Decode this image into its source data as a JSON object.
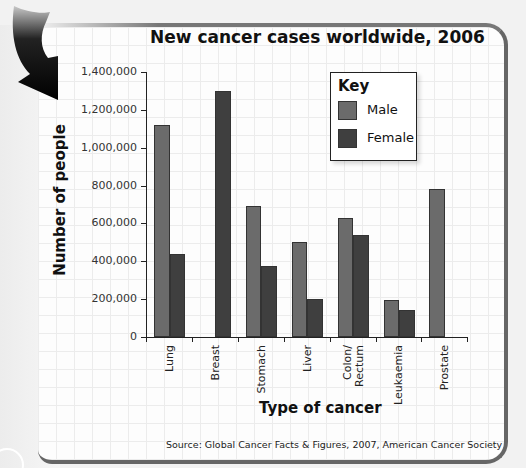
{
  "title": "New cancer cases worldwide, 2006",
  "source": "Source: Global Cancer Facts & Figures, 2007,  American Cancer Society",
  "colors": {
    "male": "#6b6b6b",
    "female": "#3f3f3f",
    "panel_border": "#666666",
    "arrow": "#111111"
  },
  "legend": {
    "title": "Key",
    "items": [
      {
        "label": "Male"
      },
      {
        "label": "Female"
      }
    ]
  },
  "axes": {
    "y_label": "Number of people",
    "x_label": "Type of cancer",
    "y_ticks": [
      "0",
      "200,000",
      "400,000",
      "600,000",
      "800,000",
      "1,000,000",
      "1,200,000",
      "1,400,000"
    ]
  },
  "categories": [
    "Lung",
    "Breast",
    "Stomach",
    "Liver",
    "Colon/\nRectum",
    "Leukaemia",
    "Prostate"
  ],
  "chart_data": {
    "type": "bar",
    "title": "New cancer cases worldwide, 2006",
    "xlabel": "Type of cancer",
    "ylabel": "Number of people",
    "categories": [
      "Lung",
      "Breast",
      "Stomach",
      "Liver",
      "Colon/Rectum",
      "Leukaemia",
      "Prostate"
    ],
    "series": [
      {
        "name": "Male",
        "values": [
          1120000,
          0,
          690000,
          500000,
          630000,
          195000,
          780000
        ]
      },
      {
        "name": "Female",
        "values": [
          440000,
          1300000,
          375000,
          200000,
          540000,
          145000,
          0
        ]
      }
    ],
    "ylim": [
      0,
      1400000
    ],
    "yticks": [
      0,
      200000,
      400000,
      600000,
      800000,
      1000000,
      1200000,
      1400000
    ],
    "grid": true,
    "legend_position": "upper right",
    "legend_title": "Key",
    "annotations": [
      "Source: Global Cancer Facts & Figures, 2007,  American Cancer Society"
    ]
  }
}
